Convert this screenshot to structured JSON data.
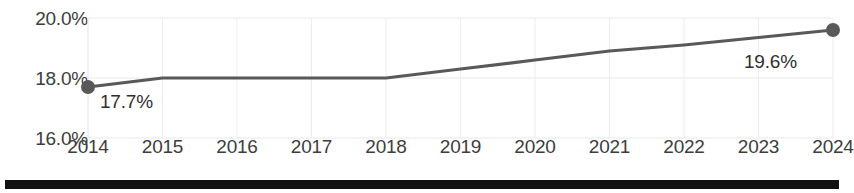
{
  "chart_data": {
    "type": "line",
    "title": "",
    "subtitle": "",
    "xlabel": "",
    "ylabel": "",
    "categories": [
      "2014",
      "2015",
      "2016",
      "2017",
      "2018",
      "2019",
      "2020",
      "2021",
      "2022",
      "2023",
      "2024"
    ],
    "values": [
      17.7,
      18.0,
      18.0,
      18.0,
      18.0,
      18.3,
      18.6,
      18.9,
      19.1,
      19.35,
      19.6
    ],
    "series": [
      {
        "name": "",
        "values": [
          17.7,
          18.0,
          18.0,
          18.0,
          18.0,
          18.3,
          18.6,
          18.9,
          19.1,
          19.35,
          19.6
        ]
      }
    ],
    "ylim": [
      16.0,
      20.0
    ],
    "y_ticks": [
      16.0,
      18.0,
      20.0
    ],
    "y_tick_labels": [
      "16.0%",
      "18.0%",
      "20.0%"
    ],
    "x_tick_labels": [
      "2014",
      "2015",
      "2016",
      "2017",
      "2018",
      "2019",
      "2020",
      "2021",
      "2022",
      "2023",
      "2024"
    ],
    "grid": true,
    "legend": false,
    "legend_position": "none",
    "markers": [
      {
        "category": "2014",
        "value": 17.7,
        "label": "17.7%"
      },
      {
        "category": "2024",
        "value": 19.6,
        "label": "19.6%"
      }
    ],
    "annotations": [
      {
        "name": "first-point-label",
        "text": "17.7%"
      },
      {
        "name": "last-point-label",
        "text": "19.6%"
      }
    ],
    "colors": {
      "line": "#595959",
      "marker": "#595959",
      "grid": "#e8e8e8",
      "axis_text": "#3d3d3d",
      "data_label_text": "#2f2f2f",
      "background": "#ffffff",
      "bottom_bar": "#111111"
    }
  }
}
